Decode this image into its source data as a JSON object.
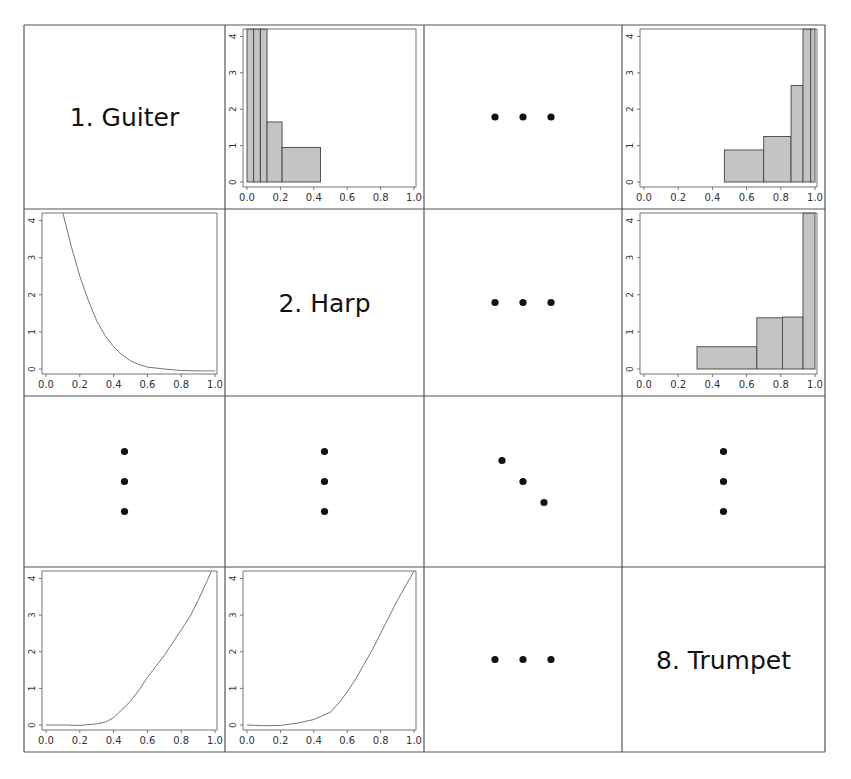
{
  "chart_data": {
    "type": "scatter-matrix",
    "title": "",
    "layout": {
      "rows": 4,
      "cols": 4,
      "grid": true
    },
    "variables": [
      "1. Guiter",
      "2. Harp",
      "…",
      "8. Trumpet"
    ],
    "axis": {
      "x_ticks": [
        "0.0",
        "0.2",
        "0.4",
        "0.6",
        "0.8",
        "1.0"
      ],
      "y_ticks": [
        "0",
        "1",
        "2",
        "3",
        "4"
      ],
      "xlim": [
        0,
        1
      ],
      "ylim": [
        0,
        4
      ]
    },
    "cells": [
      {
        "row": 0,
        "col": 0,
        "kind": "label",
        "text": "1. Guiter"
      },
      {
        "row": 0,
        "col": 1,
        "kind": "histogram",
        "bins": [
          {
            "x0": 0.0,
            "x1": 0.04,
            "h": 4.2
          },
          {
            "x0": 0.04,
            "x1": 0.08,
            "h": 4.2
          },
          {
            "x0": 0.08,
            "x1": 0.12,
            "h": 4.2
          },
          {
            "x0": 0.12,
            "x1": 0.21,
            "h": 1.65
          },
          {
            "x0": 0.21,
            "x1": 0.44,
            "h": 0.95
          }
        ]
      },
      {
        "row": 0,
        "col": 2,
        "kind": "ellipsis-horizontal"
      },
      {
        "row": 0,
        "col": 3,
        "kind": "histogram",
        "bins": [
          {
            "x0": 0.47,
            "x1": 0.7,
            "h": 0.88
          },
          {
            "x0": 0.7,
            "x1": 0.86,
            "h": 1.25
          },
          {
            "x0": 0.86,
            "x1": 0.93,
            "h": 2.65
          },
          {
            "x0": 0.93,
            "x1": 0.975,
            "h": 4.2
          },
          {
            "x0": 0.975,
            "x1": 1.0,
            "h": 4.2
          }
        ]
      },
      {
        "row": 1,
        "col": 0,
        "kind": "density",
        "points": [
          [
            0.1,
            4.2
          ],
          [
            0.15,
            3.3
          ],
          [
            0.2,
            2.5
          ],
          [
            0.25,
            1.85
          ],
          [
            0.3,
            1.3
          ],
          [
            0.35,
            0.9
          ],
          [
            0.4,
            0.6
          ],
          [
            0.45,
            0.38
          ],
          [
            0.5,
            0.22
          ],
          [
            0.55,
            0.12
          ],
          [
            0.6,
            0.05
          ],
          [
            0.7,
            0.0
          ],
          [
            0.8,
            -0.04
          ],
          [
            0.9,
            -0.05
          ],
          [
            1.0,
            -0.05
          ]
        ]
      },
      {
        "row": 1,
        "col": 1,
        "kind": "label",
        "text": "2. Harp"
      },
      {
        "row": 1,
        "col": 2,
        "kind": "ellipsis-horizontal"
      },
      {
        "row": 1,
        "col": 3,
        "kind": "histogram",
        "bins": [
          {
            "x0": 0.31,
            "x1": 0.66,
            "h": 0.6
          },
          {
            "x0": 0.66,
            "x1": 0.81,
            "h": 1.38
          },
          {
            "x0": 0.81,
            "x1": 0.93,
            "h": 1.4
          },
          {
            "x0": 0.93,
            "x1": 1.0,
            "h": 4.2
          }
        ]
      },
      {
        "row": 2,
        "col": 0,
        "kind": "ellipsis-vertical"
      },
      {
        "row": 2,
        "col": 1,
        "kind": "ellipsis-vertical"
      },
      {
        "row": 2,
        "col": 2,
        "kind": "ellipsis-diagonal"
      },
      {
        "row": 2,
        "col": 3,
        "kind": "ellipsis-vertical"
      },
      {
        "row": 3,
        "col": 0,
        "kind": "density",
        "points": [
          [
            0.0,
            0.0
          ],
          [
            0.1,
            0.0
          ],
          [
            0.2,
            -0.01
          ],
          [
            0.3,
            0.03
          ],
          [
            0.35,
            0.08
          ],
          [
            0.4,
            0.2
          ],
          [
            0.45,
            0.42
          ],
          [
            0.5,
            0.65
          ],
          [
            0.55,
            0.95
          ],
          [
            0.6,
            1.3
          ],
          [
            0.65,
            1.6
          ],
          [
            0.7,
            1.9
          ],
          [
            0.75,
            2.25
          ],
          [
            0.8,
            2.6
          ],
          [
            0.85,
            2.95
          ],
          [
            0.9,
            3.4
          ],
          [
            0.95,
            3.9
          ],
          [
            0.98,
            4.3
          ]
        ]
      },
      {
        "row": 3,
        "col": 1,
        "kind": "density",
        "points": [
          [
            0.0,
            0.0
          ],
          [
            0.1,
            -0.02
          ],
          [
            0.2,
            -0.01
          ],
          [
            0.3,
            0.05
          ],
          [
            0.4,
            0.15
          ],
          [
            0.5,
            0.35
          ],
          [
            0.55,
            0.6
          ],
          [
            0.6,
            0.9
          ],
          [
            0.65,
            1.25
          ],
          [
            0.7,
            1.65
          ],
          [
            0.75,
            2.05
          ],
          [
            0.8,
            2.5
          ],
          [
            0.85,
            2.95
          ],
          [
            0.9,
            3.4
          ],
          [
            0.95,
            3.8
          ],
          [
            1.0,
            4.2
          ]
        ]
      },
      {
        "row": 3,
        "col": 2,
        "kind": "ellipsis-horizontal"
      },
      {
        "row": 3,
        "col": 3,
        "kind": "label",
        "text": "8. Trumpet"
      }
    ]
  }
}
